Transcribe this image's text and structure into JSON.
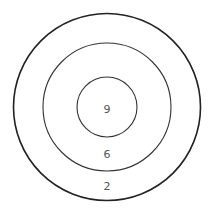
{
  "diagram": {
    "type": "concentric-circles",
    "rings": [
      {
        "name": "outer",
        "value": "2"
      },
      {
        "name": "middle",
        "value": "6"
      },
      {
        "name": "inner",
        "value": "9"
      }
    ]
  },
  "colors": {
    "stroke": "#333333",
    "text": "#555555",
    "background": "#ffffff"
  }
}
